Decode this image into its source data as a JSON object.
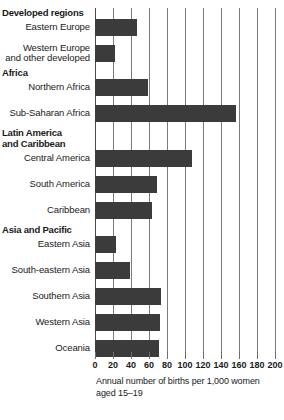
{
  "chart_data": {
    "type": "bar",
    "orientation": "horizontal",
    "title": "",
    "xlabel": "Annual number of births per 1,000 women aged 15–19",
    "ylabel": "",
    "xlim": [
      0,
      200
    ],
    "xticks": [
      0,
      20,
      40,
      60,
      80,
      100,
      120,
      140,
      160,
      180,
      200
    ],
    "grid": true,
    "legend": false,
    "bar_color": "#3b3b3b",
    "groups": [
      {
        "name": "Developed regions",
        "lines": [
          "Developed regions"
        ],
        "items": [
          {
            "label": "Eastern Europe",
            "lines": [
              "Eastern Europe"
            ],
            "value": 47
          },
          {
            "label": "Western Europe and other developed",
            "lines": [
              "Western Europe",
              "and other developed"
            ],
            "value": 22
          }
        ]
      },
      {
        "name": "Africa",
        "lines": [
          "Africa"
        ],
        "items": [
          {
            "label": "Northern Africa",
            "lines": [
              "Northern Africa"
            ],
            "value": 59
          },
          {
            "label": "Sub-Saharan Africa",
            "lines": [
              "Sub-Saharan Africa"
            ],
            "value": 157
          }
        ]
      },
      {
        "name": "Latin America and Caribbean",
        "lines": [
          "Latin America",
          "and Caribbean"
        ],
        "items": [
          {
            "label": "Central America",
            "lines": [
              "Central America"
            ],
            "value": 108
          },
          {
            "label": "South America",
            "lines": [
              "South America"
            ],
            "value": 69
          },
          {
            "label": "Caribbean",
            "lines": [
              "Caribbean"
            ],
            "value": 63
          }
        ]
      },
      {
        "name": "Asia and Pacific",
        "lines": [
          "Asia and Pacific"
        ],
        "items": [
          {
            "label": "Eastern Asia",
            "lines": [
              "Eastern Asia"
            ],
            "value": 23
          },
          {
            "label": "South-eastern Asia",
            "lines": [
              "South-eastern Asia"
            ],
            "value": 39
          },
          {
            "label": "Southern Asia",
            "lines": [
              "Southern Asia"
            ],
            "value": 73
          },
          {
            "label": "Western Asia",
            "lines": [
              "Western Asia"
            ],
            "value": 72
          },
          {
            "label": "Oceania",
            "lines": [
              "Oceania"
            ],
            "value": 71
          }
        ]
      }
    ],
    "categories": [
      "Eastern Europe",
      "Western Europe and other developed",
      "Northern Africa",
      "Sub-Saharan Africa",
      "Central America",
      "South America",
      "Caribbean",
      "Eastern Asia",
      "South-eastern Asia",
      "Southern Asia",
      "Western Asia",
      "Oceania"
    ],
    "values": [
      47,
      22,
      59,
      157,
      108,
      69,
      63,
      23,
      39,
      73,
      72,
      71
    ],
    "caption_lines": [
      "Annual number of births per 1,000 women",
      "aged 15–19"
    ]
  }
}
